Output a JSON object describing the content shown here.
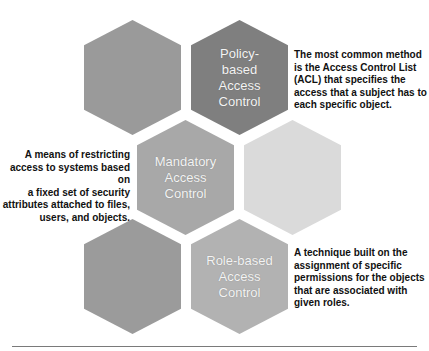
{
  "diagram": {
    "hexagons": [
      {
        "id": "top-left",
        "label": "",
        "color": "#9a9a9a"
      },
      {
        "id": "policy",
        "label": "Policy-\nbased\nAccess\nControl",
        "lines": [
          "Policy-",
          "based",
          "Access",
          "Control"
        ],
        "color": "#7f7f7f"
      },
      {
        "id": "mandatory",
        "label": "Mandatory Access Control",
        "lines": [
          "Mandatory",
          "Access",
          "Control"
        ],
        "color": "#a8a8a8"
      },
      {
        "id": "middle-right",
        "label": "",
        "color": "#dadada"
      },
      {
        "id": "bottom-left",
        "label": "",
        "color": "#9b9b9b"
      },
      {
        "id": "role",
        "label": "Role-based Access Control",
        "lines": [
          "Role-based",
          "Access",
          "Control"
        ],
        "color": "#b2b2b2"
      }
    ],
    "descriptions": {
      "policy": "The most common method is the Access Control List (ACL) that specifies the access that a subject has to each specific object.",
      "mandatory": "A means of restricting access to systems based on a fixed set of security attributes attached to files, users, and objects.",
      "role": "A technique built on the assignment of specific permissions for the objects that are associated with given roles."
    },
    "description_lines": {
      "policy": [
        "The most common method",
        "is the Access Control List",
        "(ACL) that specifies the",
        "access that a subject has to",
        "each specific object."
      ],
      "mandatory": [
        "A means of restricting",
        "access to systems based on",
        "a fixed set of security",
        "attributes attached to files,",
        "users, and objects."
      ],
      "role": [
        "A technique built on the",
        "assignment of specific",
        "permissions for the objects",
        "that are associated with",
        "given roles."
      ]
    }
  }
}
